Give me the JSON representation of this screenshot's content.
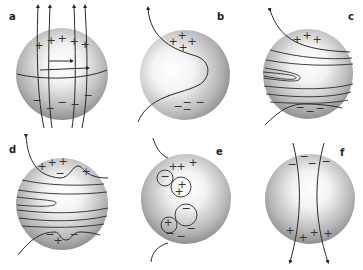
{
  "figure": {
    "panels": [
      {
        "id": "a",
        "label": "a",
        "cx": 62,
        "cy": 74,
        "r": 46,
        "positive_charges": 5,
        "negative_charges": 6,
        "description": "Sphere with vertical field lines crossing, positive charges at top, negative at bottom, two horizontal arrows near equator"
      },
      {
        "id": "b",
        "label": "b",
        "cx": 185,
        "cy": 75,
        "r": 45,
        "positive_charges": 4,
        "negative_charges": 4,
        "description": "Sphere with single S-curved field line, positive charges at top, negative at bottom"
      },
      {
        "id": "c",
        "label": "c",
        "cx": 308,
        "cy": 74,
        "r": 45,
        "positive_charges": 3,
        "negative_charges": 3,
        "description": "Sphere with wound horizontal field lines and a loop"
      },
      {
        "id": "d",
        "label": "d",
        "cx": 62,
        "cy": 204,
        "r": 46,
        "positive_charges": 5,
        "negative_charges": 3,
        "description": "Sphere with wound field lines, bumps at top and bottom with mixed charges"
      },
      {
        "id": "e",
        "label": "e",
        "cx": 186,
        "cy": 199,
        "r": 45,
        "positive_charges": 6,
        "negative_charges": 5,
        "description": "Sphere with circled charge clusters"
      },
      {
        "id": "f",
        "label": "f",
        "cx": 310,
        "cy": 199,
        "r": 45,
        "positive_charges": 4,
        "negative_charges": 4,
        "description": "Sphere with two vertical field lines pointing downward, negative charges at top, positive at bottom"
      }
    ],
    "symbols": {
      "plus": "+",
      "minus": "−"
    }
  }
}
